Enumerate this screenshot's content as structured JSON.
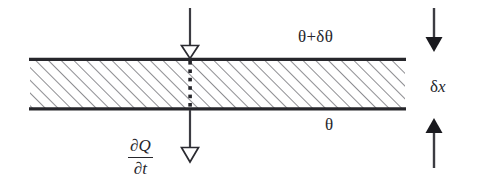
{
  "figure": {
    "kind": "thermal-conduction-slab-diagram",
    "background_color": "#ffffff",
    "ink_color": "#26262b"
  },
  "slab": {
    "name": "hatched-slab",
    "x": 30,
    "y": 58,
    "width": 375,
    "height": 52,
    "hatch_angle_deg": 45,
    "hatch_spacing": 9,
    "edge_thickness": 3.2,
    "fill_color": "#ffffff",
    "hatch_color": "#3a3a40"
  },
  "labels": {
    "top_temperature": "θ+δθ",
    "bottom_temperature": "θ",
    "thickness_delta": "δ",
    "thickness_var": "x",
    "heat_flux_numerator_partial": "∂",
    "heat_flux_numerator_var": "Q",
    "heat_flux_denominator_partial": "∂",
    "heat_flux_denominator_var": "t"
  },
  "arrows": {
    "heat_in": {
      "name": "heat-flow-in-arrow",
      "x": 190,
      "y_start": 8,
      "y_end": 57,
      "direction": "down",
      "head_style": "hollow-triangle",
      "shaft_width": 2.2
    },
    "heat_out": {
      "name": "heat-flow-out-arrow",
      "x": 190,
      "y_start": 111,
      "y_end": 163,
      "direction": "down",
      "head_style": "hollow-triangle",
      "shaft_width": 2.2
    },
    "thickness_top": {
      "name": "thickness-dimension-arrow-top",
      "x": 434,
      "y_start": 8,
      "y_end": 45,
      "direction": "down",
      "head_style": "solid-triangle",
      "shaft_width": 2.4
    },
    "thickness_bottom": {
      "name": "thickness-dimension-arrow-bottom",
      "x": 434,
      "y_start": 168,
      "y_end": 122,
      "direction": "up",
      "head_style": "solid-triangle",
      "shaft_width": 2.4
    }
  },
  "dotted_path": {
    "name": "heat-path-dotted-line",
    "x": 190,
    "y_start": 60,
    "y_end": 108,
    "dot_count": 6,
    "dot_size": 3.4,
    "color": "#26262b"
  }
}
